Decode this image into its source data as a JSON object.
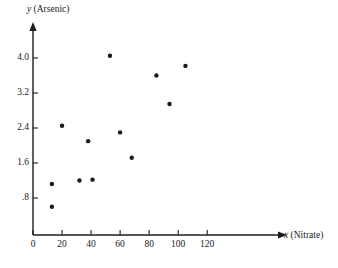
{
  "chart_data": {
    "type": "scatter",
    "title": "",
    "xlabel": "x (Nitrate)",
    "ylabel": "y (Arsenic)",
    "xlabel_var": "x",
    "xlabel_unit": "(Nitrate)",
    "ylabel_var": "y",
    "ylabel_unit": "(Arsenic)",
    "xlim": [
      0,
      135
    ],
    "ylim": [
      0,
      4.5
    ],
    "xticks": [
      0,
      20,
      40,
      60,
      80,
      100,
      120
    ],
    "xtick_labels": [
      "0",
      "20",
      "40",
      "60",
      "80",
      "100",
      "120"
    ],
    "yticks": [
      0.8,
      1.6,
      2.4,
      3.2,
      4.0
    ],
    "ytick_labels": [
      ".8",
      "1.6",
      "2.4",
      "3.2",
      "4.0"
    ],
    "grid": false,
    "legend": false,
    "marker_color": "#1a1a1a",
    "axis_color": "#1c1c1c",
    "points": [
      {
        "x": 13,
        "y": 1.12
      },
      {
        "x": 13,
        "y": 0.6
      },
      {
        "x": 20,
        "y": 2.45
      },
      {
        "x": 32,
        "y": 1.2
      },
      {
        "x": 38,
        "y": 2.1
      },
      {
        "x": 41,
        "y": 1.22
      },
      {
        "x": 53,
        "y": 4.05
      },
      {
        "x": 60,
        "y": 2.3
      },
      {
        "x": 68,
        "y": 1.72
      },
      {
        "x": 85,
        "y": 3.6
      },
      {
        "x": 94,
        "y": 2.95
      },
      {
        "x": 105,
        "y": 3.82
      }
    ]
  }
}
